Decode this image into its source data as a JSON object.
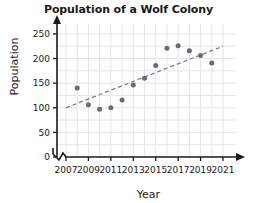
{
  "chart_data": {
    "type": "scatter",
    "title": "Population of a Wolf Colony",
    "xlabel": "Year",
    "ylabel": "Population",
    "x": [
      2008,
      2009,
      2010,
      2011,
      2012,
      2013,
      2014,
      2015,
      2016,
      2017,
      2018,
      2019,
      2020
    ],
    "values": [
      140,
      106,
      97,
      100,
      116,
      146,
      160,
      186,
      221,
      226,
      216,
      206,
      191
    ],
    "points": [
      {
        "year": 2008,
        "population": 140
      },
      {
        "year": 2009,
        "population": 106
      },
      {
        "year": 2010,
        "population": 97
      },
      {
        "year": 2011,
        "population": 100
      },
      {
        "year": 2012,
        "population": 116
      },
      {
        "year": 2013,
        "population": 146
      },
      {
        "year": 2014,
        "population": 160
      },
      {
        "year": 2015,
        "population": 186
      },
      {
        "year": 2016,
        "population": 221
      },
      {
        "year": 2017,
        "population": 226
      },
      {
        "year": 2018,
        "population": 216
      },
      {
        "year": 2019,
        "population": 206
      },
      {
        "year": 2020,
        "population": 191
      }
    ],
    "trend_line": {
      "style": "dashed",
      "x_start": 2007,
      "y_start": 100,
      "x_end": 2021,
      "y_end": 225
    },
    "xlim": [
      2006.2,
      2021.8
    ],
    "ylim": [
      0,
      262
    ],
    "xticks": [
      2007,
      2009,
      2011,
      2013,
      2015,
      2017,
      2019,
      2021
    ],
    "xtick_labels": [
      "2007",
      "2009",
      "2011",
      "2013",
      "2015",
      "2017",
      "2019",
      "2021"
    ],
    "yticks": [
      0,
      50,
      100,
      150,
      200,
      250
    ],
    "ytick_labels": [
      "0",
      "50",
      "100",
      "150",
      "200",
      "250"
    ],
    "grid": true,
    "legend": null,
    "axis_break": "x-axis-zigzag-at-origin",
    "colors": {
      "point": "#6b6b70",
      "trend": "#7a7a7e",
      "axis": "#1a1a1a",
      "grid": "#e4e4ea",
      "text": "#1a1a1a",
      "background": "#ffffff"
    }
  }
}
